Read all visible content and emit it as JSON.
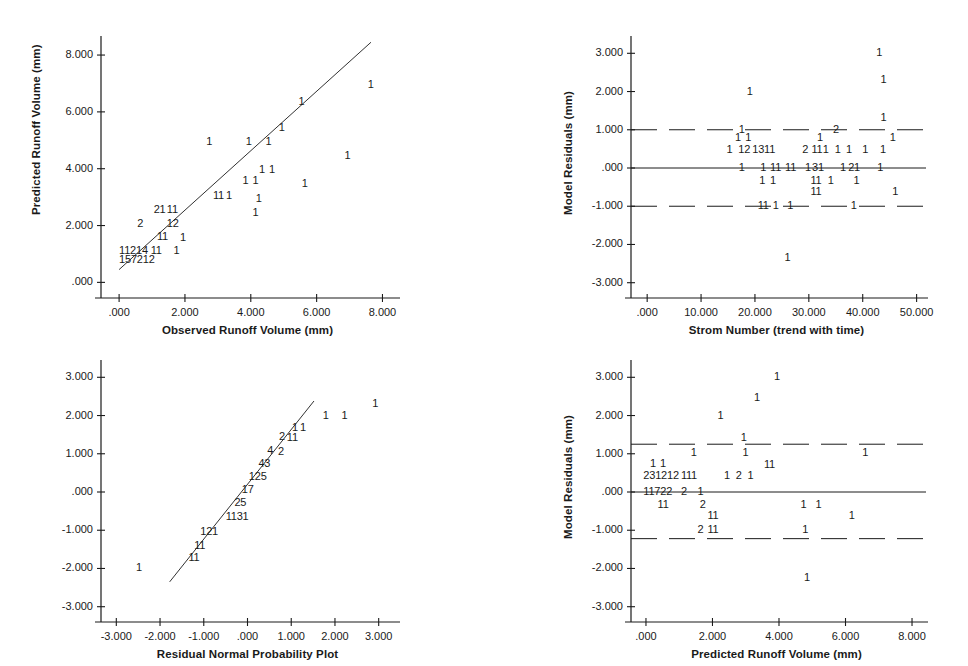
{
  "figure": {
    "title": "",
    "background": "#ffffff",
    "ink": "#1a1a1a",
    "width": 968,
    "height": 666
  },
  "chart_data": [
    {
      "id": "predicted-vs-observed",
      "type": "scatter",
      "title": "",
      "xlabel": "Observed Runoff Volume (mm)",
      "ylabel": "Predicted Runoff Volume (mm)",
      "xlim": [
        -0.55,
        8.35
      ],
      "ylim": [
        -0.55,
        8.6
      ],
      "xticks": [
        0,
        2,
        4,
        6,
        8
      ],
      "xticklabels": [
        ".000",
        "2.000",
        "4.000",
        "6.000",
        "8.000"
      ],
      "yticks": [
        0,
        2,
        4,
        6,
        8
      ],
      "yticklabels": [
        ".000",
        "2.000",
        "4.000",
        "6.000",
        "8.000"
      ],
      "grid": false,
      "legend": "none",
      "reference_line": {
        "kind": "regression",
        "x0": 0.0,
        "y0": 0.45,
        "x1": 7.65,
        "y1": 8.45
      },
      "marker_style": "digit-count",
      "points": [
        {
          "x": 7.55,
          "y": 6.95,
          "label": "1"
        },
        {
          "x": 5.45,
          "y": 6.35,
          "label": "1"
        },
        {
          "x": 4.85,
          "y": 5.45,
          "label": "1"
        },
        {
          "x": 2.65,
          "y": 4.95,
          "label": "1"
        },
        {
          "x": 3.85,
          "y": 4.95,
          "label": "1"
        },
        {
          "x": 4.45,
          "y": 4.95,
          "label": "1"
        },
        {
          "x": 6.85,
          "y": 4.45,
          "label": "1"
        },
        {
          "x": 4.25,
          "y": 3.95,
          "label": "1"
        },
        {
          "x": 4.55,
          "y": 3.95,
          "label": "1"
        },
        {
          "x": 3.75,
          "y": 3.55,
          "label": "1"
        },
        {
          "x": 4.05,
          "y": 3.55,
          "label": "1"
        },
        {
          "x": 5.55,
          "y": 3.45,
          "label": "1"
        },
        {
          "x": 2.85,
          "y": 3.05,
          "label": "11"
        },
        {
          "x": 3.25,
          "y": 3.05,
          "label": "1"
        },
        {
          "x": 4.15,
          "y": 2.95,
          "label": "1"
        },
        {
          "x": 4.05,
          "y": 2.45,
          "label": "1"
        },
        {
          "x": 1.05,
          "y": 2.55,
          "label": "21"
        },
        {
          "x": 1.45,
          "y": 2.55,
          "label": "11"
        },
        {
          "x": 0.55,
          "y": 2.05,
          "label": "2"
        },
        {
          "x": 1.45,
          "y": 2.05,
          "label": "12"
        },
        {
          "x": 1.15,
          "y": 1.6,
          "label": "11"
        },
        {
          "x": 1.85,
          "y": 1.55,
          "label": "1"
        },
        {
          "x": 0.0,
          "y": 1.1,
          "label": "11214 11"
        },
        {
          "x": 1.65,
          "y": 1.1,
          "label": "1"
        },
        {
          "x": 0.0,
          "y": 0.78,
          "label": "157212"
        }
      ]
    },
    {
      "id": "residuals-vs-storm-number",
      "type": "scatter",
      "title": "",
      "xlabel": "Strom Number (trend with time)",
      "ylabel": "Model Residuals (mm)",
      "xlim": [
        -3.0,
        51.0
      ],
      "ylim": [
        -3.4,
        3.4
      ],
      "xticks": [
        0,
        10,
        20,
        30,
        40,
        50
      ],
      "xticklabels": [
        ".000",
        "10.000",
        "20.000",
        "30.000",
        "40.000",
        "50.000"
      ],
      "yticks": [
        3,
        2,
        1,
        0,
        -1,
        -2,
        -3
      ],
      "yticklabels": [
        "3.000",
        "2.000",
        "1.000",
        ".000",
        "-1.000",
        "-2.000",
        "-3.000"
      ],
      "grid": false,
      "legend": "none",
      "zero_line": {
        "y": 0.0,
        "style": "solid"
      },
      "bands": [
        {
          "y": 1.0,
          "style": "dashed"
        },
        {
          "y": -1.0,
          "style": "dashed"
        }
      ],
      "marker_style": "digit-count",
      "points": [
        {
          "x": 42.5,
          "y": 3.0,
          "label": "1"
        },
        {
          "x": 43.3,
          "y": 2.3,
          "label": "1"
        },
        {
          "x": 18.5,
          "y": 2.0,
          "label": "1"
        },
        {
          "x": 43.3,
          "y": 1.32,
          "label": "1"
        },
        {
          "x": 17.0,
          "y": 1.0,
          "label": "1"
        },
        {
          "x": 34.5,
          "y": 1.0,
          "label": "2"
        },
        {
          "x": 16.3,
          "y": 0.78,
          "label": "1"
        },
        {
          "x": 18.2,
          "y": 0.78,
          "label": "1"
        },
        {
          "x": 31.5,
          "y": 0.78,
          "label": "1"
        },
        {
          "x": 45.0,
          "y": 0.78,
          "label": "1"
        },
        {
          "x": 14.7,
          "y": 0.48,
          "label": "1"
        },
        {
          "x": 16.9,
          "y": 0.48,
          "label": "12"
        },
        {
          "x": 19.5,
          "y": 0.48,
          "label": "1311"
        },
        {
          "x": 28.8,
          "y": 0.48,
          "label": "2"
        },
        {
          "x": 30.5,
          "y": 0.48,
          "label": "11"
        },
        {
          "x": 32.6,
          "y": 0.48,
          "label": "1"
        },
        {
          "x": 34.8,
          "y": 0.48,
          "label": "1"
        },
        {
          "x": 36.9,
          "y": 0.48,
          "label": "1"
        },
        {
          "x": 39.9,
          "y": 0.48,
          "label": "1"
        },
        {
          "x": 43.2,
          "y": 0.48,
          "label": "1"
        },
        {
          "x": 17.0,
          "y": 0.0,
          "label": "1"
        },
        {
          "x": 21.0,
          "y": 0.0,
          "label": "1"
        },
        {
          "x": 22.8,
          "y": 0.0,
          "label": "11"
        },
        {
          "x": 25.6,
          "y": 0.0,
          "label": "11"
        },
        {
          "x": 29.3,
          "y": 0.0,
          "label": "1"
        },
        {
          "x": 30.6,
          "y": 0.0,
          "label": "31"
        },
        {
          "x": 35.8,
          "y": 0.0,
          "label": "1"
        },
        {
          "x": 37.3,
          "y": 0.0,
          "label": "21"
        },
        {
          "x": 42.7,
          "y": 0.0,
          "label": "1"
        },
        {
          "x": 20.8,
          "y": -0.33,
          "label": "1"
        },
        {
          "x": 22.8,
          "y": -0.33,
          "label": "1"
        },
        {
          "x": 30.3,
          "y": -0.33,
          "label": "11"
        },
        {
          "x": 33.5,
          "y": -0.33,
          "label": "1"
        },
        {
          "x": 38.3,
          "y": -0.33,
          "label": "1"
        },
        {
          "x": 30.3,
          "y": -0.62,
          "label": "11"
        },
        {
          "x": 45.5,
          "y": -0.62,
          "label": "1"
        },
        {
          "x": 20.5,
          "y": -1.0,
          "label": "11"
        },
        {
          "x": 23.3,
          "y": -1.0,
          "label": "1"
        },
        {
          "x": 26.0,
          "y": -1.0,
          "label": "1"
        },
        {
          "x": 37.8,
          "y": -1.0,
          "label": "1"
        },
        {
          "x": 25.5,
          "y": -2.35,
          "label": "1"
        }
      ]
    },
    {
      "id": "residual-normal-probability-plot",
      "type": "scatter",
      "title": "",
      "xlabel": "Residual Normal Probability Plot",
      "ylabel": "",
      "xlim": [
        -3.35,
        3.35
      ],
      "ylim": [
        -3.4,
        3.4
      ],
      "xticks": [
        -3,
        -2,
        -1,
        0,
        1,
        2,
        3
      ],
      "xticklabels": [
        "-3.000",
        "-2.000",
        "-1.000",
        ".000",
        "1.000",
        "2.000",
        "3.000"
      ],
      "yticks": [
        3,
        2,
        1,
        0,
        -1,
        -2,
        -3
      ],
      "yticklabels": [
        "3.000",
        "2.000",
        "1.000",
        ".000",
        "-1.000",
        "-2.000",
        "-3.000"
      ],
      "grid": false,
      "legend": "none",
      "reference_line": {
        "kind": "normal-fit",
        "x0": -1.78,
        "y0": -2.35,
        "x1": 1.52,
        "y1": 2.38
      },
      "marker_style": "digit-count",
      "points": [
        {
          "x": 2.85,
          "y": 2.3,
          "label": "1"
        },
        {
          "x": 1.72,
          "y": 2.0,
          "label": "1"
        },
        {
          "x": 2.15,
          "y": 2.0,
          "label": "1"
        },
        {
          "x": 1.02,
          "y": 1.68,
          "label": "1"
        },
        {
          "x": 1.2,
          "y": 1.68,
          "label": "1"
        },
        {
          "x": 0.72,
          "y": 1.43,
          "label": "2"
        },
        {
          "x": 0.9,
          "y": 1.4,
          "label": "11"
        },
        {
          "x": 0.45,
          "y": 1.08,
          "label": "4"
        },
        {
          "x": 0.7,
          "y": 1.05,
          "label": "2"
        },
        {
          "x": 0.25,
          "y": 0.72,
          "label": "43"
        },
        {
          "x": 0.03,
          "y": 0.4,
          "label": "125"
        },
        {
          "x": -0.13,
          "y": 0.05,
          "label": "17"
        },
        {
          "x": -0.3,
          "y": -0.3,
          "label": "25"
        },
        {
          "x": -0.5,
          "y": -0.65,
          "label": "1131"
        },
        {
          "x": -1.08,
          "y": -1.05,
          "label": "121"
        },
        {
          "x": -1.22,
          "y": -1.4,
          "label": "11"
        },
        {
          "x": -1.35,
          "y": -1.72,
          "label": "11"
        },
        {
          "x": -2.55,
          "y": -2.0,
          "label": "1"
        }
      ]
    },
    {
      "id": "residuals-vs-predicted",
      "type": "scatter",
      "title": "",
      "xlabel": "Predicted Runoff Volume (mm)",
      "ylabel": "Model Residuals (mm)",
      "xlim": [
        -0.45,
        8.3
      ],
      "ylim": [
        -3.4,
        3.4
      ],
      "xticks": [
        0,
        2,
        4,
        6,
        8
      ],
      "xticklabels": [
        ".000",
        "2.000",
        "4.000",
        "6.000",
        "8.000"
      ],
      "yticks": [
        3,
        2,
        1,
        0,
        -1,
        -2,
        -3
      ],
      "yticklabels": [
        "3.000",
        "2.000",
        "1.000",
        ".000",
        "-1.000",
        "-2.000",
        "-3.000"
      ],
      "grid": false,
      "legend": "none",
      "zero_line": {
        "y": 0.0,
        "style": "solid"
      },
      "bands": [
        {
          "y": 1.25,
          "style": "dashed"
        },
        {
          "y": -1.22,
          "style": "dashed"
        }
      ],
      "marker_style": "digit-count",
      "points": [
        {
          "x": 3.85,
          "y": 3.0,
          "label": "1"
        },
        {
          "x": 3.25,
          "y": 2.45,
          "label": "1"
        },
        {
          "x": 2.15,
          "y": 2.0,
          "label": "1"
        },
        {
          "x": 2.85,
          "y": 1.42,
          "label": "1"
        },
        {
          "x": 1.35,
          "y": 1.02,
          "label": "1"
        },
        {
          "x": 2.9,
          "y": 1.02,
          "label": "1"
        },
        {
          "x": 6.5,
          "y": 1.02,
          "label": "1"
        },
        {
          "x": 0.12,
          "y": 0.72,
          "label": "1"
        },
        {
          "x": 0.42,
          "y": 0.72,
          "label": "1"
        },
        {
          "x": 3.55,
          "y": 0.7,
          "label": "11"
        },
        {
          "x": -0.08,
          "y": 0.42,
          "label": "231212"
        },
        {
          "x": 1.05,
          "y": 0.42,
          "label": "111"
        },
        {
          "x": 2.35,
          "y": 0.42,
          "label": "1"
        },
        {
          "x": 2.7,
          "y": 0.42,
          "label": "2"
        },
        {
          "x": 3.05,
          "y": 0.42,
          "label": "1"
        },
        {
          "x": -0.08,
          "y": 0.0,
          "label": "11722"
        },
        {
          "x": 1.05,
          "y": 0.0,
          "label": "2"
        },
        {
          "x": 1.55,
          "y": 0.0,
          "label": "1"
        },
        {
          "x": 0.35,
          "y": -0.33,
          "label": "11"
        },
        {
          "x": 1.62,
          "y": -0.33,
          "label": "2"
        },
        {
          "x": 4.65,
          "y": -0.33,
          "label": "1"
        },
        {
          "x": 5.1,
          "y": -0.33,
          "label": "1"
        },
        {
          "x": 1.85,
          "y": -0.62,
          "label": "11"
        },
        {
          "x": 6.1,
          "y": -0.62,
          "label": "1"
        },
        {
          "x": 1.55,
          "y": -1.0,
          "label": "2"
        },
        {
          "x": 1.85,
          "y": -1.0,
          "label": "11"
        },
        {
          "x": 4.7,
          "y": -1.0,
          "label": "1"
        },
        {
          "x": 4.75,
          "y": -2.25,
          "label": "1"
        }
      ]
    }
  ]
}
